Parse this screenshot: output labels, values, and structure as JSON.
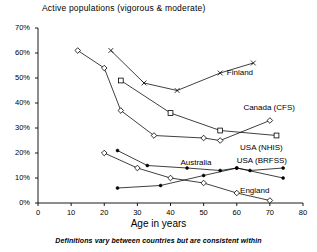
{
  "chart_data": {
    "type": "line",
    "title": "Active populations (vigorous & moderate)",
    "xlabel": "Age in years",
    "ylabel": "",
    "footnote": "Definitions vary between countries but are consistent within",
    "xlim": [
      0,
      80
    ],
    "ylim": [
      0,
      70
    ],
    "xticks": [
      "0",
      "10",
      "20",
      "30",
      "40",
      "50",
      "60",
      "70",
      "80"
    ],
    "yticks": [
      "0%",
      "10%",
      "20%",
      "30%",
      "40%",
      "50%",
      "60%",
      "70%"
    ],
    "xtick_values": [
      0,
      10,
      20,
      30,
      40,
      50,
      60,
      70,
      80
    ],
    "ytick_values": [
      0,
      10,
      20,
      30,
      40,
      50,
      60,
      70
    ],
    "grid": false,
    "legend_position": "inline-right",
    "series": [
      {
        "name": "Finland",
        "marker": "cross",
        "label_x": 57,
        "label_y": 52,
        "points": [
          {
            "x": 22,
            "y": 61
          },
          {
            "x": 32,
            "y": 48
          },
          {
            "x": 42,
            "y": 45
          },
          {
            "x": 55,
            "y": 52
          },
          {
            "x": 65,
            "y": 56
          }
        ]
      },
      {
        "name": "Canada (CFS)",
        "marker": "diamond",
        "label_x": 62,
        "label_y": 38,
        "points": [
          {
            "x": 12,
            "y": 61
          },
          {
            "x": 20,
            "y": 54
          },
          {
            "x": 25,
            "y": 37
          },
          {
            "x": 35,
            "y": 27
          },
          {
            "x": 50,
            "y": 26
          },
          {
            "x": 55,
            "y": 25
          },
          {
            "x": 70,
            "y": 33
          }
        ]
      },
      {
        "name": "USA (NHIS)",
        "marker": "square",
        "label_x": 61,
        "label_y": 22,
        "points": [
          {
            "x": 25,
            "y": 49
          },
          {
            "x": 40,
            "y": 36
          },
          {
            "x": 55,
            "y": 29
          },
          {
            "x": 72,
            "y": 27
          }
        ]
      },
      {
        "name": "Australia",
        "marker": "filled-dot",
        "label_x": 43,
        "label_y": 16,
        "points": [
          {
            "x": 24,
            "y": 21
          },
          {
            "x": 33,
            "y": 15
          },
          {
            "x": 45,
            "y": 14
          },
          {
            "x": 55,
            "y": 13
          },
          {
            "x": 60,
            "y": 14
          },
          {
            "x": 64,
            "y": 13
          },
          {
            "x": 74,
            "y": 14
          }
        ]
      },
      {
        "name": "USA (BRFSS)",
        "marker": "filled-dot",
        "label_x": 60,
        "label_y": 17,
        "points": [
          {
            "x": 24,
            "y": 6
          },
          {
            "x": 37,
            "y": 7
          },
          {
            "x": 50,
            "y": 11
          },
          {
            "x": 60,
            "y": 14
          },
          {
            "x": 74,
            "y": 10
          }
        ]
      },
      {
        "name": "England",
        "marker": "diamond",
        "label_x": 61,
        "label_y": 5,
        "points": [
          {
            "x": 20,
            "y": 20
          },
          {
            "x": 30,
            "y": 14
          },
          {
            "x": 40,
            "y": 10
          },
          {
            "x": 50,
            "y": 8
          },
          {
            "x": 60,
            "y": 4
          },
          {
            "x": 70,
            "y": 1
          }
        ]
      }
    ]
  }
}
